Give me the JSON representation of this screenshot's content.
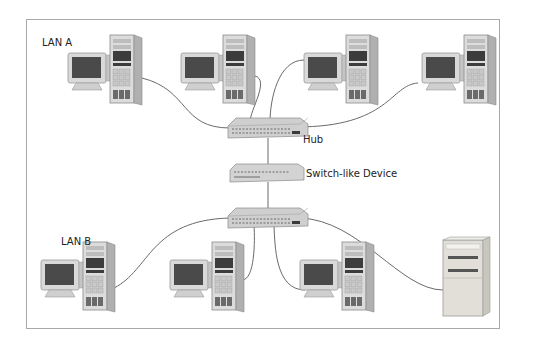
{
  "diagram": {
    "labels": {
      "lan_a": "LAN A",
      "lan_b": "LAN B",
      "hub": "Hub",
      "switch": "Switch-like Device"
    },
    "lan_a_workstations": [
      {
        "x": 68,
        "y": 35
      },
      {
        "x": 181,
        "y": 35
      },
      {
        "x": 304,
        "y": 35
      },
      {
        "x": 422,
        "y": 35
      }
    ],
    "lan_b_workstations": [
      {
        "x": 41,
        "y": 242
      },
      {
        "x": 170,
        "y": 242
      },
      {
        "x": 300,
        "y": 242
      }
    ],
    "lan_b_server": {
      "x": 443,
      "y": 238
    },
    "colors": {
      "border": "#a8a8a8",
      "cable": "#6a6a6a",
      "device_body": "#d6d6d6",
      "screen": "#4a4a4a"
    }
  }
}
